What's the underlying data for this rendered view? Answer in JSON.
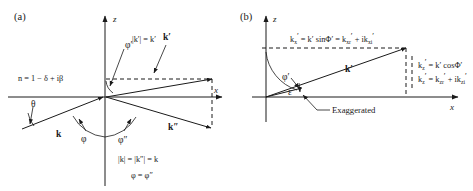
{
  "figure": {
    "panels": [
      {
        "id": "a",
        "label": "(a)",
        "axis_z": "z",
        "axis_x": "x",
        "medium_index": "n = 1 − δ + iβ",
        "angle_theta": "θ",
        "angle_phi": "φ",
        "angle_phi_double_prime": "φ″",
        "angle_phi_prime": "φ′",
        "vector_k": "k",
        "vector_k_prime": "k′",
        "vector_k_double_prime": "k″",
        "note_magnitude_prime": "|k′| = k′",
        "note_magnitude": "|k| = |k″| = k",
        "note_angle_equality": "φ = φ″"
      },
      {
        "id": "b",
        "label": "(b)",
        "axis_z": "z",
        "axis_x": "x",
        "vector_k_prime": "k′",
        "angle_phi_prime": "φ′",
        "angle_epsilon": "ε",
        "note_exaggerated": "Exaggerated",
        "eq_kx": {
          "base": "k",
          "sub": "x",
          "prime": "′",
          "full": "k′x = k′ sinφ′ = k′xr + ik′xi",
          "parts": [
            "k′x",
            " = k′ sinφ′ = ",
            "k′xr",
            " + i",
            "k′xi"
          ]
        },
        "eq_kz_1": {
          "full": "k′z = k′ cosφ′",
          "parts": [
            "k′z",
            " = k′ cosφ′"
          ]
        },
        "eq_kz_2": {
          "full": "k′z = k′zr + ik′zi",
          "parts": [
            "k′z",
            " = ",
            "k′zr",
            " + i",
            "k′zi"
          ]
        }
      }
    ],
    "colors": {
      "ink": "#1a1a1a",
      "background": "#ffffff"
    }
  }
}
